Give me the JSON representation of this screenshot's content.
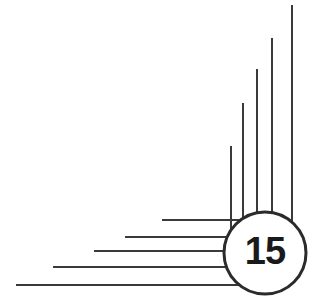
{
  "figure": {
    "canvas": {
      "width": 313,
      "height": 308,
      "background": "#ffffff"
    },
    "stroke_color": "#3a3a3a",
    "stroke_width": 2,
    "badge": {
      "label": "15",
      "center_x": 265,
      "center_y": 253,
      "radius": 41,
      "fill": "#ffffff",
      "stroke": "#2b2b2b",
      "stroke_width": 3,
      "text_color": "#1a1a1a"
    },
    "vertical_rays": [
      {
        "name": "vertical-ray-1",
        "x": 231,
        "y_top": 146,
        "y_bottom": 253
      },
      {
        "name": "vertical-ray-2",
        "x": 243,
        "y_top": 103,
        "y_bottom": 253
      },
      {
        "name": "vertical-ray-3",
        "x": 257,
        "y_top": 69,
        "y_bottom": 253
      },
      {
        "name": "vertical-ray-4",
        "x": 272,
        "y_top": 38,
        "y_bottom": 253
      },
      {
        "name": "vertical-ray-5",
        "x": 292,
        "y_top": 5,
        "y_bottom": 253
      }
    ],
    "horizontal_rays": [
      {
        "name": "horizontal-ray-1",
        "y": 220,
        "x_left": 162,
        "x_right": 265
      },
      {
        "name": "horizontal-ray-2",
        "y": 237,
        "x_left": 125,
        "x_right": 265
      },
      {
        "name": "horizontal-ray-3",
        "y": 251,
        "x_left": 94,
        "x_right": 265
      },
      {
        "name": "horizontal-ray-4",
        "y": 267,
        "x_left": 53,
        "x_right": 265
      },
      {
        "name": "horizontal-ray-5",
        "y": 285,
        "x_left": 16,
        "x_right": 265
      }
    ]
  }
}
